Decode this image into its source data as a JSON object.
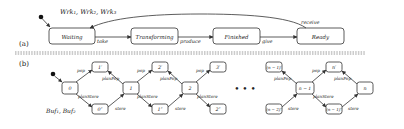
{
  "part_a": {
    "section_label": "(a)",
    "group_label": "Wrk₁, Wrk₂, Wrk₃",
    "states": [
      {
        "id": "waiting",
        "label": "Waiting"
      },
      {
        "id": "transforming",
        "label": "Transforming"
      },
      {
        "id": "finished",
        "label": "Finished"
      },
      {
        "id": "ready",
        "label": "Ready"
      }
    ],
    "transitions": [
      {
        "from": "waiting",
        "to": "transforming",
        "label": "take"
      },
      {
        "from": "transforming",
        "to": "finished",
        "label": "produce"
      },
      {
        "from": "finished",
        "to": "ready",
        "label": "give"
      },
      {
        "from": "ready",
        "to": "waiting",
        "label": "receive"
      }
    ]
  },
  "part_b": {
    "section_label": "(b)",
    "group_label": "Buf₁, Buf₂",
    "states": [
      {
        "id": "s0",
        "label": "0"
      },
      {
        "id": "s1p",
        "label": "1′"
      },
      {
        "id": "s0pp",
        "label": "0″"
      },
      {
        "id": "s1",
        "label": "1"
      },
      {
        "id": "s2p",
        "label": "2′"
      },
      {
        "id": "s1pp",
        "label": "1″"
      },
      {
        "id": "s2",
        "label": "2"
      },
      {
        "id": "s3p",
        "label": "3′"
      },
      {
        "id": "s2pp",
        "label": "2″"
      },
      {
        "id": "snm1p",
        "label": "(n − 1)′"
      },
      {
        "id": "snm2pp",
        "label": "(n − 2)″"
      },
      {
        "id": "snm1",
        "label": "n − 1"
      },
      {
        "id": "snp",
        "label": "n′"
      },
      {
        "id": "snm1pp",
        "label": "(n − 1)″"
      },
      {
        "id": "sn",
        "label": "n"
      }
    ],
    "edge_labels": {
      "pop": "pop",
      "planPop": "planPop",
      "planStore": "planStore",
      "store": "store"
    },
    "ellipsis": "• • •"
  }
}
